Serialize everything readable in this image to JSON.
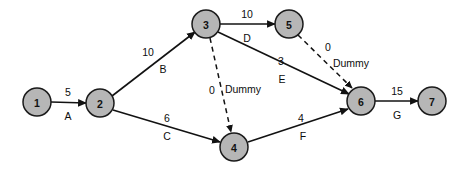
{
  "diagram": {
    "background_color": "#ffffff",
    "node_fill_color": "#b6b6b6",
    "node_stroke_color": "#1a1a1a",
    "edge_color": "#121212",
    "nodes": [
      {
        "id": "n1",
        "label": "1",
        "cx": 37,
        "cy": 102,
        "r": 14
      },
      {
        "id": "n2",
        "label": "2",
        "cx": 100,
        "cy": 103,
        "r": 14
      },
      {
        "id": "n3",
        "label": "3",
        "cx": 206,
        "cy": 24,
        "r": 14
      },
      {
        "id": "n4",
        "label": "4",
        "cx": 234,
        "cy": 147,
        "r": 14
      },
      {
        "id": "n5",
        "label": "5",
        "cx": 289,
        "cy": 24,
        "r": 14
      },
      {
        "id": "n6",
        "label": "6",
        "cx": 361,
        "cy": 101,
        "r": 14
      },
      {
        "id": "n7",
        "label": "7",
        "cx": 432,
        "cy": 101,
        "r": 14
      }
    ],
    "edges": [
      {
        "id": "e-A",
        "from": "n1",
        "to": "n2",
        "duration": "5",
        "activity": "A",
        "style": "solid",
        "x1": 51,
        "y1": 102,
        "x2": 86,
        "y2": 103,
        "dur_x": 68,
        "dur_y": 92,
        "act_x": 68,
        "act_y": 116
      },
      {
        "id": "e-B",
        "from": "n2",
        "to": "n3",
        "duration": "10",
        "activity": "B",
        "style": "solid",
        "x1": 112,
        "y1": 96,
        "x2": 195,
        "y2": 32,
        "dur_x": 148,
        "dur_y": 52,
        "act_x": 163,
        "act_y": 69
      },
      {
        "id": "e-C",
        "from": "n2",
        "to": "n4",
        "duration": "6",
        "activity": "C",
        "style": "solid",
        "x1": 113,
        "y1": 110,
        "x2": 220,
        "y2": 142,
        "dur_x": 167,
        "dur_y": 118,
        "act_x": 167,
        "act_y": 136
      },
      {
        "id": "e-D",
        "from": "n3",
        "to": "n5",
        "duration": "10",
        "activity": "D",
        "style": "solid",
        "x1": 220,
        "y1": 24,
        "x2": 275,
        "y2": 24,
        "dur_x": 247,
        "dur_y": 14,
        "act_x": 247,
        "act_y": 38
      },
      {
        "id": "e-dummy1",
        "from": "n3",
        "to": "n4",
        "duration": "0",
        "activity": "Dummy",
        "style": "dashed",
        "x1": 210,
        "y1": 38,
        "x2": 231,
        "y2": 132,
        "dur_x": 212,
        "dur_y": 90,
        "act_x": 243,
        "act_y": 89
      },
      {
        "id": "e-E",
        "from": "n3",
        "to": "n6",
        "duration": "3",
        "activity": "E",
        "style": "solid",
        "x1": 218,
        "y1": 32,
        "x2": 349,
        "y2": 94,
        "dur_x": 281,
        "dur_y": 61,
        "act_x": 282,
        "act_y": 79
      },
      {
        "id": "e-dummy2",
        "from": "n5",
        "to": "n6",
        "duration": "0",
        "activity": "Dummy",
        "style": "dashed",
        "x1": 298,
        "y1": 35,
        "x2": 352,
        "y2": 88,
        "dur_x": 328,
        "dur_y": 47,
        "act_x": 351,
        "act_y": 63
      },
      {
        "id": "e-F",
        "from": "n4",
        "to": "n6",
        "duration": "4",
        "activity": "F",
        "style": "solid",
        "x1": 248,
        "y1": 142,
        "x2": 348,
        "y2": 109,
        "dur_x": 301,
        "dur_y": 118,
        "act_x": 303,
        "act_y": 136
      },
      {
        "id": "e-G",
        "from": "n6",
        "to": "n7",
        "duration": "15",
        "activity": "G",
        "style": "solid",
        "x1": 375,
        "y1": 101,
        "x2": 418,
        "y2": 101,
        "dur_x": 397,
        "dur_y": 91,
        "act_x": 397,
        "act_y": 115
      }
    ]
  }
}
